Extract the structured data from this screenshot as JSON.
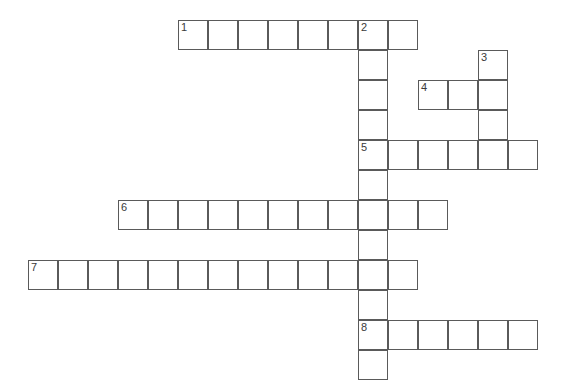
{
  "puzzle": {
    "title": "Crossword Puzzle Grid",
    "cell_size": 30,
    "origin_x": 28,
    "origin_y": 20,
    "grid_line_color": "#5a5a5a",
    "cell_fill_color": "#ffffff",
    "background_color": "#ffffff",
    "number_color": "#3a3a3a"
  },
  "entries": [
    {
      "number": "1",
      "direction": "across",
      "row": 0,
      "col": 5,
      "length": 8,
      "answer_text": ""
    },
    {
      "number": "2",
      "direction": "down",
      "row": 0,
      "col": 11,
      "length": 12,
      "answer_text": ""
    },
    {
      "number": "3",
      "direction": "down",
      "row": 1,
      "col": 15,
      "length": 4,
      "answer_text": ""
    },
    {
      "number": "4",
      "direction": "across",
      "row": 2,
      "col": 13,
      "length": 3,
      "answer_text": ""
    },
    {
      "number": "5",
      "direction": "across",
      "row": 4,
      "col": 11,
      "length": 6,
      "answer_text": ""
    },
    {
      "number": "6",
      "direction": "across",
      "row": 6,
      "col": 3,
      "length": 11,
      "answer_text": ""
    },
    {
      "number": "7",
      "direction": "across",
      "row": 8,
      "col": 0,
      "length": 13,
      "answer_text": ""
    },
    {
      "number": "8",
      "direction": "across",
      "row": 10,
      "col": 11,
      "length": 6,
      "answer_text": ""
    }
  ],
  "cells": [
    {
      "row": 0,
      "col": 5,
      "number": "1"
    },
    {
      "row": 0,
      "col": 6,
      "number": ""
    },
    {
      "row": 0,
      "col": 7,
      "number": ""
    },
    {
      "row": 0,
      "col": 8,
      "number": ""
    },
    {
      "row": 0,
      "col": 9,
      "number": ""
    },
    {
      "row": 0,
      "col": 10,
      "number": ""
    },
    {
      "row": 0,
      "col": 11,
      "number": "2"
    },
    {
      "row": 0,
      "col": 12,
      "number": ""
    },
    {
      "row": 1,
      "col": 11,
      "number": ""
    },
    {
      "row": 1,
      "col": 15,
      "number": "3"
    },
    {
      "row": 2,
      "col": 11,
      "number": ""
    },
    {
      "row": 2,
      "col": 13,
      "number": "4"
    },
    {
      "row": 2,
      "col": 14,
      "number": ""
    },
    {
      "row": 2,
      "col": 15,
      "number": ""
    },
    {
      "row": 3,
      "col": 11,
      "number": ""
    },
    {
      "row": 3,
      "col": 15,
      "number": ""
    },
    {
      "row": 4,
      "col": 11,
      "number": "5"
    },
    {
      "row": 4,
      "col": 12,
      "number": ""
    },
    {
      "row": 4,
      "col": 13,
      "number": ""
    },
    {
      "row": 4,
      "col": 14,
      "number": ""
    },
    {
      "row": 4,
      "col": 15,
      "number": ""
    },
    {
      "row": 4,
      "col": 16,
      "number": ""
    },
    {
      "row": 5,
      "col": 11,
      "number": ""
    },
    {
      "row": 6,
      "col": 3,
      "number": "6"
    },
    {
      "row": 6,
      "col": 4,
      "number": ""
    },
    {
      "row": 6,
      "col": 5,
      "number": ""
    },
    {
      "row": 6,
      "col": 6,
      "number": ""
    },
    {
      "row": 6,
      "col": 7,
      "number": ""
    },
    {
      "row": 6,
      "col": 8,
      "number": ""
    },
    {
      "row": 6,
      "col": 9,
      "number": ""
    },
    {
      "row": 6,
      "col": 10,
      "number": ""
    },
    {
      "row": 6,
      "col": 11,
      "number": ""
    },
    {
      "row": 6,
      "col": 12,
      "number": ""
    },
    {
      "row": 6,
      "col": 13,
      "number": ""
    },
    {
      "row": 7,
      "col": 11,
      "number": ""
    },
    {
      "row": 8,
      "col": 0,
      "number": "7"
    },
    {
      "row": 8,
      "col": 1,
      "number": ""
    },
    {
      "row": 8,
      "col": 2,
      "number": ""
    },
    {
      "row": 8,
      "col": 3,
      "number": ""
    },
    {
      "row": 8,
      "col": 4,
      "number": ""
    },
    {
      "row": 8,
      "col": 5,
      "number": ""
    },
    {
      "row": 8,
      "col": 6,
      "number": ""
    },
    {
      "row": 8,
      "col": 7,
      "number": ""
    },
    {
      "row": 8,
      "col": 8,
      "number": ""
    },
    {
      "row": 8,
      "col": 9,
      "number": ""
    },
    {
      "row": 8,
      "col": 10,
      "number": ""
    },
    {
      "row": 8,
      "col": 11,
      "number": ""
    },
    {
      "row": 8,
      "col": 12,
      "number": ""
    },
    {
      "row": 9,
      "col": 11,
      "number": ""
    },
    {
      "row": 10,
      "col": 11,
      "number": "8"
    },
    {
      "row": 10,
      "col": 12,
      "number": ""
    },
    {
      "row": 10,
      "col": 13,
      "number": ""
    },
    {
      "row": 10,
      "col": 14,
      "number": ""
    },
    {
      "row": 10,
      "col": 15,
      "number": ""
    },
    {
      "row": 10,
      "col": 16,
      "number": ""
    },
    {
      "row": 11,
      "col": 11,
      "number": ""
    }
  ]
}
